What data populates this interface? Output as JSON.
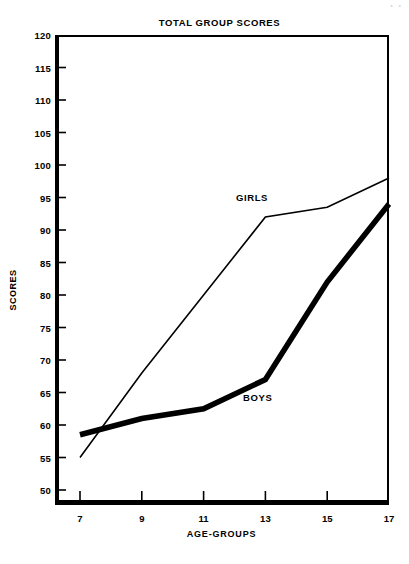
{
  "figure": {
    "corner_artifact": "• •",
    "title": "TOTAL GROUP SCORES",
    "xlabel": "AGE-GROUPS",
    "ylabel": "SCORES"
  },
  "chart_data": {
    "type": "line",
    "title": "TOTAL GROUP SCORES",
    "xlabel": "AGE-GROUPS",
    "ylabel": "SCORES",
    "x": [
      7,
      9,
      11,
      13,
      15,
      17
    ],
    "xtick_labels": [
      "7",
      "9",
      "11",
      "13",
      "15",
      "17"
    ],
    "xlim": [
      6,
      18
    ],
    "ylim": [
      47,
      120
    ],
    "ytick_labels": [
      "120",
      "115",
      "110",
      "105",
      "100",
      "95",
      "90",
      "85",
      "80",
      "75",
      "70",
      "65",
      "60",
      "55",
      "50"
    ],
    "yticks": [
      120,
      115,
      110,
      105,
      100,
      95,
      90,
      85,
      80,
      75,
      70,
      65,
      60,
      55,
      50
    ],
    "grid": false,
    "legend": "inline-annotations",
    "series": [
      {
        "name": "GIRLS",
        "style": "thin",
        "color": "#000000",
        "line_width": 1.6,
        "values": [
          55,
          68,
          80,
          92,
          93.5,
          98
        ],
        "label_position": {
          "x": 236,
          "y": 192
        }
      },
      {
        "name": "BOYS",
        "style": "thick",
        "color": "#000000",
        "line_width": 5.5,
        "values": [
          58.5,
          61,
          62.5,
          67,
          82,
          94
        ],
        "label_position": {
          "x": 243,
          "y": 392
        }
      }
    ]
  }
}
